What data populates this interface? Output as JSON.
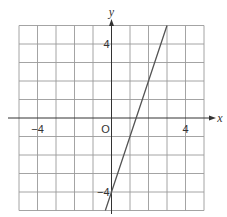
{
  "chart_data": {
    "type": "line",
    "title": "",
    "xlabel": "x",
    "ylabel": "y",
    "xlim": [
      -5,
      5
    ],
    "ylim": [
      -5,
      5
    ],
    "grid": true,
    "origin_label": "O",
    "x_ticks": [
      {
        "value": -4,
        "label": "−4"
      },
      {
        "value": 4,
        "label": "4"
      }
    ],
    "y_ticks": [
      {
        "value": 4,
        "label": "4"
      },
      {
        "value": -4,
        "label": "−4"
      }
    ],
    "series": [
      {
        "name": "y = 3x − 4",
        "x": [
          -0.333,
          3
        ],
        "y": [
          -5,
          5
        ],
        "slope": 3,
        "intercept": -4
      }
    ]
  },
  "colors": {
    "grid": "#999999",
    "axis": "#333333",
    "line": "#555555"
  }
}
